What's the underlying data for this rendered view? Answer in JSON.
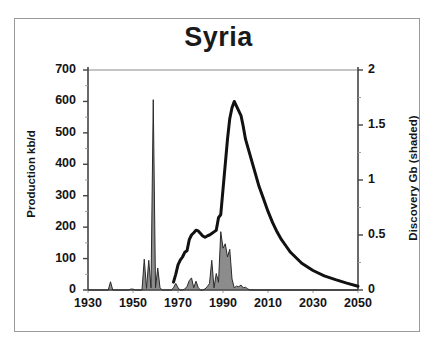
{
  "chart_data": {
    "type": "line",
    "title": "Syria",
    "xlabel": "",
    "ylabel": "Production kb/d",
    "y2label": "Discovery Gb (shaded)",
    "xlim": [
      1930,
      2050
    ],
    "ylim": [
      0,
      700
    ],
    "y2lim": [
      0,
      2
    ],
    "xticks": [
      1930,
      1950,
      1970,
      1990,
      2010,
      2030,
      2050
    ],
    "xtick_labels": [
      "1930",
      "1950",
      "1970",
      "1990",
      "2010",
      "2030",
      "2050"
    ],
    "yticks": [
      0,
      100,
      200,
      300,
      400,
      500,
      600,
      700
    ],
    "ytick_labels": [
      "0",
      "100",
      "200",
      "300",
      "400",
      "500",
      "600",
      "700"
    ],
    "yticks_minor": [
      50,
      150,
      250,
      350,
      450,
      550,
      650
    ],
    "y2ticks": [
      0,
      0.5,
      1,
      1.5,
      2
    ],
    "y2tick_labels": [
      "0",
      "0.5",
      "1",
      "1.5",
      "2"
    ],
    "y2ticks_minor": [
      0.25,
      0.75,
      1.25,
      1.75
    ],
    "grid": false,
    "legend": "none",
    "series": [
      {
        "name": "Production kb/d",
        "axis": "left",
        "kind": "line",
        "color": "#111111",
        "linewidth": 3,
        "x": [
          1968,
          1969,
          1970,
          1971,
          1972,
          1973,
          1974,
          1975,
          1976,
          1977,
          1978,
          1979,
          1980,
          1981,
          1982,
          1983,
          1984,
          1985,
          1986,
          1987,
          1988,
          1989,
          1990,
          1991,
          1992,
          1993,
          1994,
          1995,
          1996,
          1997,
          1998,
          1999,
          2000,
          2002,
          2004,
          2006,
          2008,
          2010,
          2012,
          2014,
          2016,
          2018,
          2020,
          2025,
          2030,
          2035,
          2040,
          2045,
          2050
        ],
        "y": [
          25,
          50,
          80,
          95,
          105,
          120,
          125,
          160,
          175,
          182,
          190,
          188,
          180,
          172,
          168,
          172,
          175,
          180,
          185,
          190,
          230,
          240,
          320,
          400,
          480,
          545,
          580,
          600,
          585,
          570,
          555,
          520,
          480,
          430,
          380,
          330,
          290,
          250,
          215,
          185,
          160,
          140,
          120,
          85,
          62,
          45,
          33,
          22,
          12
        ]
      },
      {
        "name": "Discovery Gb (shaded)",
        "axis": "right",
        "kind": "area",
        "color": "#8c8c8c",
        "edgecolor": "#2b2b2b",
        "x": [
          1930,
          1938,
          1939,
          1940,
          1941,
          1942,
          1948,
          1949,
          1950,
          1951,
          1954,
          1955,
          1956,
          1957,
          1958,
          1959,
          1960,
          1961,
          1962,
          1963,
          1964,
          1965,
          1966,
          1967,
          1968,
          1969,
          1970,
          1971,
          1972,
          1973,
          1974,
          1975,
          1976,
          1977,
          1978,
          1979,
          1980,
          1981,
          1982,
          1983,
          1984,
          1985,
          1986,
          1987,
          1988,
          1989,
          1990,
          1991,
          1992,
          1993,
          1994,
          1995,
          1996,
          1997,
          1998,
          1999,
          2000,
          2001,
          2002,
          2050
        ],
        "y": [
          0,
          0,
          0,
          0.075,
          0,
          0,
          0,
          0.008,
          0.008,
          0,
          0,
          0.28,
          0.015,
          0.27,
          0.02,
          1.73,
          0.02,
          0.2,
          0.02,
          0,
          0,
          0,
          0,
          0,
          0.02,
          0.06,
          0.02,
          0,
          0,
          0.01,
          0.03,
          0.085,
          0.11,
          0.02,
          0.08,
          0.02,
          0,
          0,
          0.01,
          0.03,
          0.06,
          0.27,
          0.02,
          0.15,
          0.07,
          0.53,
          0.38,
          0.42,
          0.3,
          0.37,
          0.1,
          0.02,
          0.035,
          0.03,
          0.045,
          0.02,
          0.025,
          0.01,
          0,
          0
        ]
      }
    ],
    "annotations": []
  },
  "frame": {
    "border_color": "#9a9a9a",
    "background": "#ffffff"
  },
  "axis_color": "#444444",
  "text_color": "#141414"
}
